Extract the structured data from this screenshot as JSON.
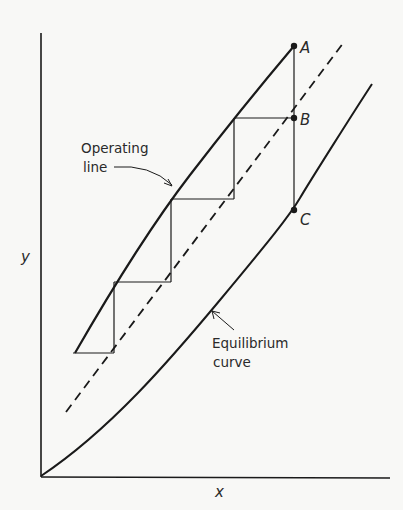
{
  "diagram": {
    "type": "mccabe-thiele-style stage construction",
    "axes": {
      "x_label": "x",
      "y_label": "y"
    },
    "curves": {
      "operating_line": {
        "label_line1": "Operating",
        "label_line2": "line"
      },
      "equilibrium_curve": {
        "label_line1": "Equilibrium",
        "label_line2": "curve"
      },
      "dashed_line": {
        "style": "dashed"
      }
    },
    "points": [
      {
        "id": "A",
        "label": "A"
      },
      {
        "id": "B",
        "label": "B"
      },
      {
        "id": "C",
        "label": "C"
      }
    ],
    "stages": 4,
    "colors": {
      "ink": "#1a1a1a",
      "background": "#f8f8f6"
    }
  }
}
